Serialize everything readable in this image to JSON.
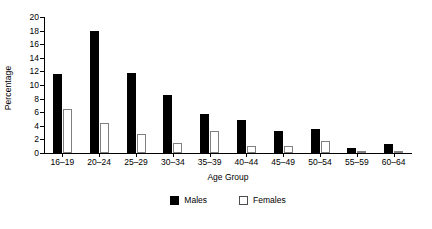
{
  "chart_data": {
    "type": "bar",
    "title": "",
    "xlabel": "Age Group",
    "ylabel": "Percentage",
    "categories": [
      "16–19",
      "20–24",
      "25–29",
      "30–34",
      "35–39",
      "40–44",
      "45–49",
      "50–54",
      "55–59",
      "60–64"
    ],
    "series": [
      {
        "name": "Males",
        "color": "#000000",
        "values": [
          11.6,
          17.9,
          11.7,
          8.6,
          5.8,
          4.8,
          3.2,
          3.5,
          0.8,
          1.3
        ]
      },
      {
        "name": "Females",
        "color": "#ffffff",
        "values": [
          6.5,
          4.4,
          2.8,
          1.5,
          3.2,
          1.0,
          1.0,
          1.7,
          0.2,
          0.2
        ]
      }
    ],
    "ylim": [
      0,
      20
    ],
    "yticks": [
      0,
      2,
      4,
      6,
      8,
      10,
      12,
      14,
      16,
      18,
      20
    ],
    "ytick_labels": [
      "0",
      "2",
      "4",
      "6",
      "8",
      "10",
      "12",
      "14",
      "16",
      "18",
      "20"
    ],
    "grid": false,
    "legend_position": "bottom-center",
    "legend_entries": [
      "Males",
      "Females"
    ]
  }
}
